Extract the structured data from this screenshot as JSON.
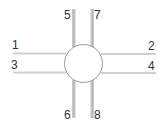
{
  "diagram": {
    "type": "pin-connector",
    "center_shape": "circle",
    "colors": {
      "line": "#c8c8c8",
      "line_shadow": "#a8a8a8",
      "circle_stroke": "#9a9a9a",
      "circle_fill": "#ffffff",
      "label": "#333333"
    },
    "pins": [
      {
        "id": "1",
        "label": "1",
        "side": "left",
        "position": "upper"
      },
      {
        "id": "2",
        "label": "2",
        "side": "right",
        "position": "upper"
      },
      {
        "id": "3",
        "label": "3",
        "side": "left",
        "position": "lower"
      },
      {
        "id": "4",
        "label": "4",
        "side": "right",
        "position": "lower"
      },
      {
        "id": "5",
        "label": "5",
        "side": "top",
        "position": "left"
      },
      {
        "id": "6",
        "label": "6",
        "side": "bottom",
        "position": "left"
      },
      {
        "id": "7",
        "label": "7",
        "side": "top",
        "position": "right"
      },
      {
        "id": "8",
        "label": "8",
        "side": "bottom",
        "position": "right"
      }
    ]
  }
}
